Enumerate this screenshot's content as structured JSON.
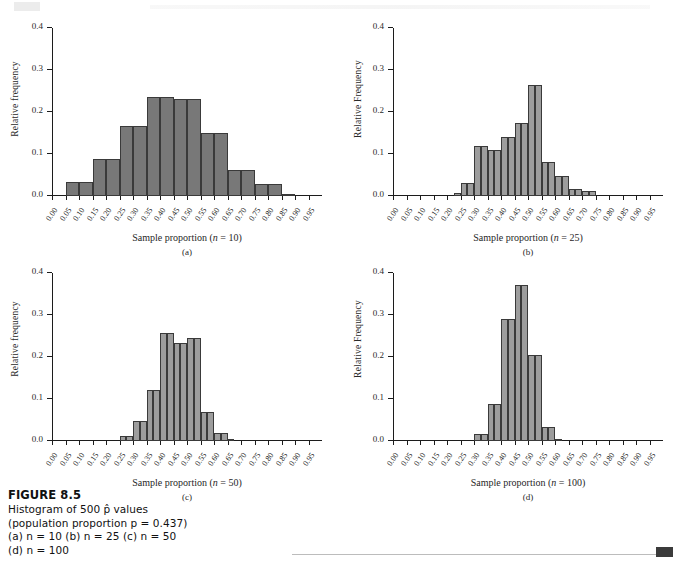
{
  "figure": {
    "caption_title": "FIGURE 8.5",
    "caption_lines": [
      "Histogram of 500 p̂ values",
      "(population proportion p = 0.437)",
      "(a) n = 10 (b) n = 25 (c) n = 50",
      "(d) n = 100"
    ]
  },
  "axis": {
    "y_ticks": [
      0.0,
      0.1,
      0.2,
      0.3,
      0.4
    ],
    "y_tick_labels": [
      "0.0",
      "0.1",
      "0.2",
      "0.3",
      "0.4"
    ],
    "x_ticks": [
      0.0,
      0.05,
      0.1,
      0.15,
      0.2,
      0.25,
      0.3,
      0.35,
      0.4,
      0.45,
      0.5,
      0.55,
      0.6,
      0.65,
      0.7,
      0.75,
      0.8,
      0.85,
      0.9,
      0.95
    ],
    "x_tick_labels": [
      "0.00",
      "0.05",
      "0.10",
      "0.15",
      "0.20",
      "0.25",
      "0.30",
      "0.35",
      "0.40",
      "0.45",
      "0.50",
      "0.55",
      "0.60",
      "0.65",
      "0.70",
      "0.75",
      "0.80",
      "0.85",
      "0.90",
      "0.95"
    ],
    "xlim": [
      0.0,
      1.0
    ],
    "ylim": [
      0.0,
      0.4
    ]
  },
  "colors": {
    "bar_dark": "#787878",
    "bar_light": "#9d9d9d",
    "bar_edge": "#3a3a3a",
    "axis": "#1c1c1c",
    "footer_marker": "#3b3b3b"
  },
  "chart_data": [
    {
      "id": "a",
      "type": "bar",
      "panel_letter": "(a)",
      "title": "",
      "xlabel": "Sample proportion (n = 10)",
      "xlabel_prefix": "Sample proportion (",
      "xlabel_var": "n",
      "xlabel_suffix": " = 10)",
      "ylabel": "Relative frequency",
      "n": 10,
      "bar_color": "#787878",
      "bin_width": 0.05,
      "bin_starts": [
        0.05,
        0.1,
        0.15,
        0.2,
        0.25,
        0.3,
        0.35,
        0.4,
        0.45,
        0.5,
        0.55,
        0.6,
        0.65,
        0.7,
        0.75,
        0.8,
        0.85
      ],
      "values": [
        0.0,
        0.034,
        0.034,
        0.088,
        0.088,
        0.166,
        0.166,
        0.235,
        0.235,
        0.231,
        0.231,
        0.149,
        0.149,
        0.062,
        0.062,
        0.029,
        0.004
      ],
      "bars": [
        {
          "x0": 0.05,
          "x1": 0.1,
          "y": 0.034
        },
        {
          "x0": 0.1,
          "x1": 0.15,
          "y": 0.034
        },
        {
          "x0": 0.15,
          "x1": 0.2,
          "y": 0.088
        },
        {
          "x0": 0.2,
          "x1": 0.25,
          "y": 0.088
        },
        {
          "x0": 0.25,
          "x1": 0.3,
          "y": 0.166
        },
        {
          "x0": 0.3,
          "x1": 0.35,
          "y": 0.166
        },
        {
          "x0": 0.35,
          "x1": 0.4,
          "y": 0.235
        },
        {
          "x0": 0.4,
          "x1": 0.45,
          "y": 0.235
        },
        {
          "x0": 0.45,
          "x1": 0.5,
          "y": 0.231
        },
        {
          "x0": 0.5,
          "x1": 0.55,
          "y": 0.231
        },
        {
          "x0": 0.55,
          "x1": 0.6,
          "y": 0.149
        },
        {
          "x0": 0.6,
          "x1": 0.65,
          "y": 0.149
        },
        {
          "x0": 0.65,
          "x1": 0.7,
          "y": 0.062
        },
        {
          "x0": 0.7,
          "x1": 0.75,
          "y": 0.062
        },
        {
          "x0": 0.75,
          "x1": 0.8,
          "y": 0.029
        },
        {
          "x0": 0.8,
          "x1": 0.85,
          "y": 0.029
        },
        {
          "x0": 0.85,
          "x1": 0.9,
          "y": 0.004
        }
      ]
    },
    {
      "id": "b",
      "type": "bar",
      "panel_letter": "(b)",
      "title": "",
      "xlabel": "Sample proportion (n = 25)",
      "xlabel_prefix": "Sample proportion (",
      "xlabel_var": "n",
      "xlabel_suffix": " = 25)",
      "ylabel": "Relative Frequency",
      "n": 25,
      "bar_color": "#9d9d9d",
      "bin_width": 0.025,
      "bars": [
        {
          "x0": 0.2,
          "x1": 0.225,
          "y": 0.0
        },
        {
          "x0": 0.225,
          "x1": 0.25,
          "y": 0.006
        },
        {
          "x0": 0.25,
          "x1": 0.275,
          "y": 0.03
        },
        {
          "x0": 0.275,
          "x1": 0.3,
          "y": 0.03
        },
        {
          "x0": 0.3,
          "x1": 0.325,
          "y": 0.12
        },
        {
          "x0": 0.325,
          "x1": 0.35,
          "y": 0.12
        },
        {
          "x0": 0.35,
          "x1": 0.375,
          "y": 0.109
        },
        {
          "x0": 0.375,
          "x1": 0.4,
          "y": 0.109
        },
        {
          "x0": 0.4,
          "x1": 0.425,
          "y": 0.14
        },
        {
          "x0": 0.425,
          "x1": 0.45,
          "y": 0.14
        },
        {
          "x0": 0.45,
          "x1": 0.475,
          "y": 0.174
        },
        {
          "x0": 0.475,
          "x1": 0.5,
          "y": 0.174
        },
        {
          "x0": 0.5,
          "x1": 0.525,
          "y": 0.264
        },
        {
          "x0": 0.525,
          "x1": 0.55,
          "y": 0.264
        },
        {
          "x0": 0.55,
          "x1": 0.575,
          "y": 0.082
        },
        {
          "x0": 0.575,
          "x1": 0.6,
          "y": 0.082
        },
        {
          "x0": 0.6,
          "x1": 0.625,
          "y": 0.048
        },
        {
          "x0": 0.625,
          "x1": 0.65,
          "y": 0.048
        },
        {
          "x0": 0.65,
          "x1": 0.675,
          "y": 0.016
        },
        {
          "x0": 0.675,
          "x1": 0.7,
          "y": 0.016
        },
        {
          "x0": 0.7,
          "x1": 0.725,
          "y": 0.011
        },
        {
          "x0": 0.725,
          "x1": 0.75,
          "y": 0.011
        }
      ]
    },
    {
      "id": "c",
      "type": "bar",
      "panel_letter": "(c)",
      "title": "",
      "xlabel": "Sample proportion (n = 50)",
      "xlabel_prefix": "Sample proportion (",
      "xlabel_var": "n",
      "xlabel_suffix": " = 50)",
      "ylabel": "Relative frequency",
      "n": 50,
      "bar_color": "#9d9d9d",
      "bin_width": 0.025,
      "bars": [
        {
          "x0": 0.25,
          "x1": 0.275,
          "y": 0.011
        },
        {
          "x0": 0.275,
          "x1": 0.3,
          "y": 0.011
        },
        {
          "x0": 0.3,
          "x1": 0.325,
          "y": 0.048
        },
        {
          "x0": 0.325,
          "x1": 0.35,
          "y": 0.048
        },
        {
          "x0": 0.35,
          "x1": 0.375,
          "y": 0.121
        },
        {
          "x0": 0.375,
          "x1": 0.4,
          "y": 0.121
        },
        {
          "x0": 0.4,
          "x1": 0.425,
          "y": 0.257
        },
        {
          "x0": 0.425,
          "x1": 0.45,
          "y": 0.257
        },
        {
          "x0": 0.45,
          "x1": 0.475,
          "y": 0.233
        },
        {
          "x0": 0.475,
          "x1": 0.5,
          "y": 0.233
        },
        {
          "x0": 0.5,
          "x1": 0.525,
          "y": 0.245
        },
        {
          "x0": 0.525,
          "x1": 0.55,
          "y": 0.245
        },
        {
          "x0": 0.55,
          "x1": 0.575,
          "y": 0.068
        },
        {
          "x0": 0.575,
          "x1": 0.6,
          "y": 0.068
        },
        {
          "x0": 0.6,
          "x1": 0.625,
          "y": 0.018
        },
        {
          "x0": 0.625,
          "x1": 0.65,
          "y": 0.018
        },
        {
          "x0": 0.65,
          "x1": 0.675,
          "y": 0.003
        }
      ]
    },
    {
      "id": "d",
      "type": "bar",
      "panel_letter": "(d)",
      "title": "",
      "xlabel": "Sample proportion (n = 100)",
      "xlabel_prefix": "Sample proportion (",
      "xlabel_var": "n",
      "xlabel_suffix": " = 100)",
      "ylabel": "Relative Frequency",
      "n": 100,
      "bar_color": "#9d9d9d",
      "bin_width": 0.025,
      "bars": [
        {
          "x0": 0.3,
          "x1": 0.325,
          "y": 0.016
        },
        {
          "x0": 0.325,
          "x1": 0.35,
          "y": 0.016
        },
        {
          "x0": 0.35,
          "x1": 0.375,
          "y": 0.087
        },
        {
          "x0": 0.375,
          "x1": 0.4,
          "y": 0.087
        },
        {
          "x0": 0.4,
          "x1": 0.425,
          "y": 0.29
        },
        {
          "x0": 0.425,
          "x1": 0.45,
          "y": 0.29
        },
        {
          "x0": 0.45,
          "x1": 0.475,
          "y": 0.371
        },
        {
          "x0": 0.475,
          "x1": 0.5,
          "y": 0.371
        },
        {
          "x0": 0.5,
          "x1": 0.525,
          "y": 0.205
        },
        {
          "x0": 0.525,
          "x1": 0.55,
          "y": 0.205
        },
        {
          "x0": 0.55,
          "x1": 0.575,
          "y": 0.033
        },
        {
          "x0": 0.575,
          "x1": 0.6,
          "y": 0.033
        },
        {
          "x0": 0.6,
          "x1": 0.625,
          "y": 0.003
        }
      ]
    }
  ]
}
